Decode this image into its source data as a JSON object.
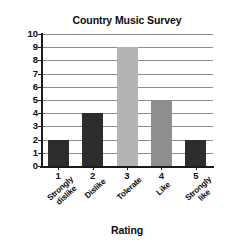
{
  "chart_data": {
    "type": "bar",
    "title": "Country Music Survey",
    "xlabel": "Rating",
    "ylabel": "Frequency",
    "categories": [
      "1",
      "2",
      "3",
      "4",
      "5"
    ],
    "category_labels": [
      "Strongly\ndislike",
      "Dislike",
      "Tolerate",
      "Like",
      "Strongly\nlike"
    ],
    "values": [
      2,
      4,
      9,
      5,
      2
    ],
    "ylim": [
      0,
      10
    ],
    "ytick_labels": [
      "0",
      "1",
      "2",
      "3",
      "4",
      "5",
      "6",
      "7",
      "8",
      "9",
      "10"
    ],
    "grid": true,
    "legend": false,
    "bar_colors": [
      "#2d2d2d",
      "#2d2d2d",
      "#b4b4b4",
      "#8e8e8e",
      "#2d2d2d"
    ],
    "axis_color": "#1a1a1a",
    "gridline_color": "#8d8d8d",
    "background_color": "#ffffff"
  }
}
